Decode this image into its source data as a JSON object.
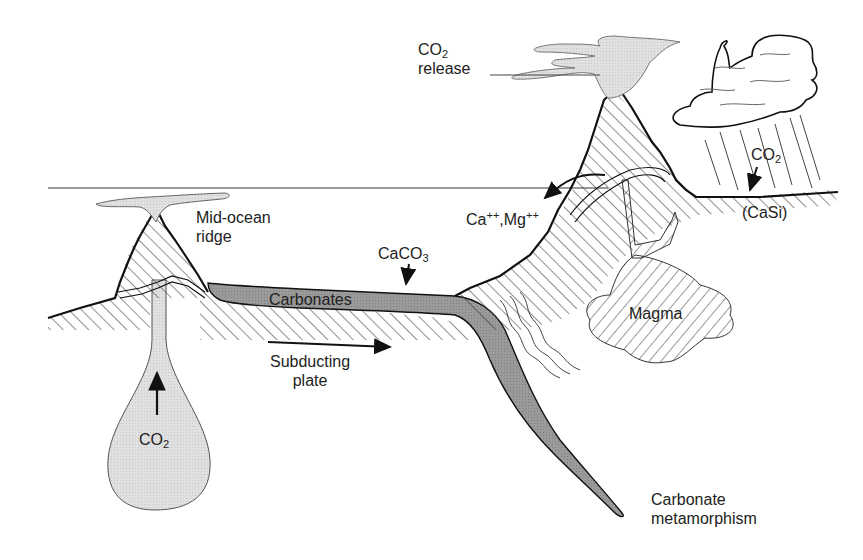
{
  "diagram": {
    "colors": {
      "outline": "#111111",
      "hatch": "#333333",
      "carbonate_fill": "#9a9a9a",
      "gas_fill": "#dedede",
      "sea_level": "#333333"
    },
    "labels": {
      "co2_release": {
        "main": "CO",
        "sub": "2",
        "line2": "release"
      },
      "mid_ocean_ridge": {
        "line1": "Mid-ocean",
        "line2": "ridge"
      },
      "ca_mg": {
        "ca": "Ca",
        "ca_sup": "++",
        "sep": ",Mg",
        "mg_sup": "++"
      },
      "caco3": {
        "main": "CaCO",
        "sub": "3"
      },
      "carbonates": "Carbonates",
      "subducting_plate": {
        "line1": "Subducting",
        "line2": "plate"
      },
      "magma": "Magma",
      "co2_weathering": {
        "main": "CO",
        "sub": "2"
      },
      "casi": "(CaSi)",
      "co2_mantle": {
        "main": "CO",
        "sub": "2"
      },
      "carbonate_metamorphism": {
        "line1": "Carbonate",
        "line2": "metamorphism"
      }
    },
    "components": [
      "volcano",
      "rain-cloud",
      "mid-ocean-ridge",
      "carbonate-layer",
      "subducting-slab",
      "magma-chamber",
      "mantle-plume",
      "sea-level-line"
    ]
  }
}
